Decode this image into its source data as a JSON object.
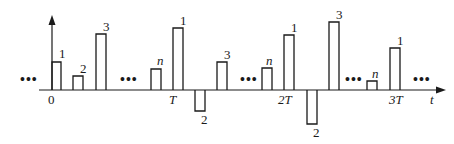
{
  "diagram": {
    "type": "periodic pulse train signal",
    "axis": {
      "t_label": "t",
      "origin_label": "0",
      "tick_labels": [
        "T",
        "2T",
        "3T"
      ]
    },
    "ellipsis": "•••",
    "pulse_labels": {
      "p1": "1",
      "p2": "2",
      "p3": "3",
      "pn": "n"
    },
    "pulses": [
      {
        "label": "1",
        "x": 52,
        "top": 62,
        "period": 0
      },
      {
        "label": "2",
        "x": 73,
        "top": 76,
        "period": 0
      },
      {
        "label": "3",
        "x": 96,
        "top": 34,
        "period": 0
      },
      {
        "label": "n",
        "x": 151,
        "top": 69,
        "period": 0
      },
      {
        "label": "1",
        "x": 173,
        "top": 28,
        "period": 1
      },
      {
        "label": "2",
        "x": 195,
        "bottom": 111,
        "period": 1,
        "negative": true
      },
      {
        "label": "3",
        "x": 217,
        "top": 62,
        "period": 1
      },
      {
        "label": "n",
        "x": 262,
        "top": 68,
        "period": 1
      },
      {
        "label": "1",
        "x": 284,
        "top": 35,
        "period": 2
      },
      {
        "label": "2",
        "x": 307,
        "bottom": 124,
        "period": 2,
        "negative": true
      },
      {
        "label": "3",
        "x": 329,
        "top": 22,
        "period": 2
      },
      {
        "label": "n",
        "x": 367,
        "top": 81,
        "period": 2
      },
      {
        "label": "1",
        "x": 390,
        "top": 48,
        "period": 3
      }
    ]
  }
}
